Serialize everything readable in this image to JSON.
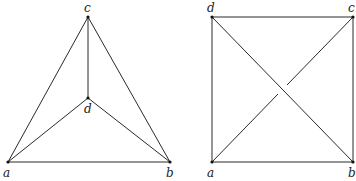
{
  "graphs": [
    {
      "name": "planar-embedding-k4",
      "vertices": [
        {
          "id": "a",
          "label": "a",
          "x": 8,
          "y": 162,
          "lx": 3,
          "ly": 177
        },
        {
          "id": "b",
          "label": "b",
          "x": 170,
          "y": 162,
          "lx": 166,
          "ly": 177
        },
        {
          "id": "c",
          "label": "c",
          "x": 88,
          "y": 17,
          "lx": 84,
          "ly": 12
        },
        {
          "id": "d",
          "label": "d",
          "x": 88,
          "y": 98,
          "lx": 84,
          "ly": 113
        }
      ],
      "edges": [
        [
          "a",
          "b"
        ],
        [
          "a",
          "c"
        ],
        [
          "b",
          "c"
        ],
        [
          "c",
          "d"
        ],
        [
          "a",
          "d"
        ],
        [
          "b",
          "d"
        ]
      ]
    },
    {
      "name": "square-embedding-k4",
      "vertices": [
        {
          "id": "a",
          "label": "a",
          "x": 212,
          "y": 162,
          "lx": 207,
          "ly": 177
        },
        {
          "id": "b",
          "label": "b",
          "x": 353,
          "y": 162,
          "lx": 348,
          "ly": 177
        },
        {
          "id": "c",
          "label": "c",
          "x": 353,
          "y": 17,
          "lx": 348,
          "ly": 12
        },
        {
          "id": "d",
          "label": "d",
          "x": 212,
          "y": 17,
          "lx": 207,
          "ly": 12
        }
      ],
      "edges": [
        [
          "a",
          "b"
        ],
        [
          "b",
          "c"
        ],
        [
          "c",
          "d"
        ],
        [
          "d",
          "a"
        ],
        [
          "d",
          "b"
        ]
      ],
      "crossing_edge": {
        "from": "a",
        "to": "c",
        "gap": true
      }
    }
  ]
}
